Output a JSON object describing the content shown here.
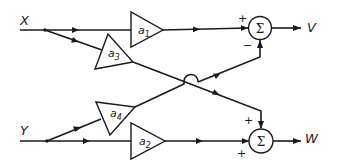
{
  "diagram": {
    "type": "signal-flow block diagram",
    "inputs": [
      {
        "id": "X",
        "label": "X"
      },
      {
        "id": "Y",
        "label": "Y"
      }
    ],
    "outputs": [
      {
        "id": "V",
        "label": "V"
      },
      {
        "id": "W",
        "label": "W"
      }
    ],
    "gains": [
      {
        "id": "a1",
        "base": "a",
        "subscript": "1"
      },
      {
        "id": "a2",
        "base": "a",
        "subscript": "2"
      },
      {
        "id": "a3",
        "base": "a",
        "subscript": "3"
      },
      {
        "id": "a4",
        "base": "a",
        "subscript": "4"
      }
    ],
    "summers": [
      {
        "id": "sum1",
        "symbol": "Σ",
        "signs": {
          "left": "+",
          "bottom": "−"
        }
      },
      {
        "id": "sum2",
        "symbol": "Σ",
        "signs": {
          "top": "+",
          "left": "+"
        }
      }
    ],
    "connections": [
      "X → a1 → sum1(+)",
      "X → a3 → sum2(+)",
      "Y → a4 → sum1(−)",
      "Y → a2 → sum2(+)",
      "sum1 → V",
      "sum2 → W"
    ],
    "stroke_color": "#1a1a1a",
    "background": "#ffffff"
  }
}
